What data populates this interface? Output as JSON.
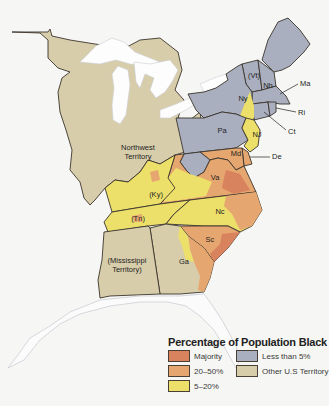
{
  "map": {
    "title": "Percentage of Population Black",
    "colors": {
      "majority": "#d9825e",
      "twenty_fifty": "#e6a66f",
      "five_twenty": "#ece06a",
      "less_than_five": "#a9afbf",
      "other_territory": "#d8cdab",
      "water": "#fdfdfd",
      "border": "#3b342c"
    },
    "regions": [
      {
        "id": "vt",
        "label": "(Vt)",
        "category": "less_than_five"
      },
      {
        "id": "nh",
        "label": "Nh",
        "category": "less_than_five"
      },
      {
        "id": "ma",
        "label": "Ma",
        "category": "less_than_five"
      },
      {
        "id": "ri",
        "label": "Ri",
        "category": "less_than_five"
      },
      {
        "id": "ct",
        "label": "Ct",
        "category": "less_than_five"
      },
      {
        "id": "ny",
        "label": "Ny",
        "category": "less_than_five"
      },
      {
        "id": "pa",
        "label": "Pa",
        "category": "less_than_five"
      },
      {
        "id": "nj",
        "label": "NJ",
        "category": "five_twenty"
      },
      {
        "id": "de",
        "label": "De",
        "category": "twenty_fifty"
      },
      {
        "id": "md",
        "label": "Md",
        "category": "twenty_fifty"
      },
      {
        "id": "va",
        "label": "Va",
        "category": "twenty_fifty"
      },
      {
        "id": "nc",
        "label": "Nc",
        "category": "five_twenty"
      },
      {
        "id": "sc",
        "label": "Sc",
        "category": "twenty_fifty"
      },
      {
        "id": "ga",
        "label": "Ga",
        "category": "other_territory"
      },
      {
        "id": "ky",
        "label": "(Ky)",
        "category": "five_twenty"
      },
      {
        "id": "tn",
        "label": "(Tn)",
        "category": "five_twenty"
      },
      {
        "id": "nw",
        "label": "Northwest Territory",
        "line1": "Northwest",
        "line2": "Territory",
        "category": "other_territory"
      },
      {
        "id": "ms",
        "label": "(Mississippi Territory)",
        "line1": "(Mississippi",
        "line2": "Territory)",
        "category": "other_territory"
      }
    ]
  },
  "legend": {
    "title": "Percentage of Population Black",
    "items": [
      {
        "label": "Majority",
        "color": "#d9825e"
      },
      {
        "label": "Less than 5%",
        "color": "#a9afbf"
      },
      {
        "label": "20–50%",
        "color": "#e6a66f"
      },
      {
        "label": "Other U.S Territory",
        "color": "#d8cdab"
      },
      {
        "label": "5–20%",
        "color": "#ece06a"
      }
    ]
  }
}
